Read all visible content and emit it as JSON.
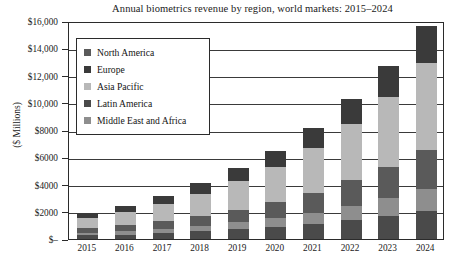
{
  "chart_data": {
    "type": "bar",
    "stacked": true,
    "title": "Annual biometrics revenue by region, world markets: 2015–2024",
    "xlabel": "",
    "ylabel": "($ Millions)",
    "categories": [
      "2015",
      "2016",
      "2017",
      "2018",
      "2019",
      "2020",
      "2021",
      "2022",
      "2023",
      "2024"
    ],
    "ylim": [
      0,
      16000
    ],
    "ytick_labels": [
      "$–",
      "$2000",
      "$4000",
      "$6000",
      "$8000",
      "$10,000",
      "$12,000",
      "$14,000",
      "$16,000"
    ],
    "ytick_values": [
      0,
      2000,
      4000,
      6000,
      8000,
      10000,
      12000,
      14000,
      16000
    ],
    "grid": true,
    "legend_position": "upper-left-inside",
    "stack_order_bottom_to_top": [
      "Latin America",
      "Middle East and Africa",
      "North America",
      "Asia Pacific",
      "Europe"
    ],
    "series": [
      {
        "name": "Latin America",
        "color": "#4a4a4a",
        "values": [
          260,
          330,
          430,
          560,
          700,
          880,
          1100,
          1400,
          1700,
          2050
        ]
      },
      {
        "name": "Middle East and Africa",
        "color": "#8e8e8e",
        "values": [
          190,
          250,
          320,
          420,
          530,
          660,
          830,
          1050,
          1300,
          1600
        ]
      },
      {
        "name": "North America",
        "color": "#5a5a5a",
        "values": [
          330,
          430,
          560,
          720,
          920,
          1150,
          1450,
          1850,
          2300,
          2850
        ]
      },
      {
        "name": "Asia Pacific",
        "color": "#b8b8b8",
        "values": [
          760,
          980,
          1270,
          1640,
          2080,
          2600,
          3300,
          4150,
          5150,
          6400
        ]
      },
      {
        "name": "Europe",
        "color": "#3a3a3a",
        "values": [
          360,
          460,
          600,
          760,
          950,
          1180,
          1470,
          1830,
          2250,
          2750
        ]
      }
    ],
    "totals": [
      1900,
      2450,
      3180,
      4100,
      5180,
      6470,
      8150,
      10280,
      12700,
      15650
    ]
  },
  "legend": {
    "items": [
      {
        "label": "North America",
        "color": "#5a5a5a"
      },
      {
        "label": "Europe",
        "color": "#3a3a3a"
      },
      {
        "label": "Asia Pacific",
        "color": "#b8b8b8"
      },
      {
        "label": "Latin America",
        "color": "#4a4a4a"
      },
      {
        "label": "Middle East and Africa",
        "color": "#8e8e8e"
      }
    ]
  }
}
